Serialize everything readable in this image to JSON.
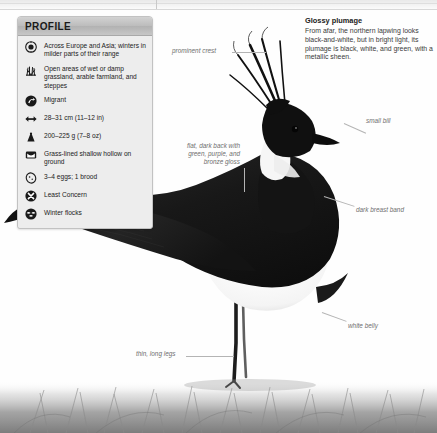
{
  "page": {
    "background_color": "#ffffff",
    "strip_color": "#eeeeee"
  },
  "profile": {
    "title": "PROFILE",
    "rows": [
      {
        "icon": "range-globe-icon",
        "text": "Across Europe and Asia;\nwinters in milder parts\nof their range"
      },
      {
        "icon": "grass-habitat-icon",
        "text": "Open areas of wet or\ndamp grassland, arable\nfarmland, and steppes"
      },
      {
        "icon": "migration-arrow-icon",
        "text": "Migrant"
      },
      {
        "icon": "size-arrows-icon",
        "text": "28–31 cm (11–12 in)"
      },
      {
        "icon": "weight-icon",
        "text": "200–225 g (7–8 oz)"
      },
      {
        "icon": "nest-icon",
        "text": "Grass-lined shallow\nhollow on ground"
      },
      {
        "icon": "egg-icon",
        "text": "3–4 eggs; 1 brood"
      },
      {
        "icon": "conservation-status-icon",
        "text": "Least Concern"
      },
      {
        "icon": "flock-icon",
        "text": "Winter flocks"
      }
    ]
  },
  "info_block": {
    "title": "Glossy plumage",
    "body": "From afar, the northern lapwing looks black-and-white, but in bright light, its plumage is black, white, and green, with a metallic sheen."
  },
  "callouts": [
    {
      "name": "prominent-crest",
      "text": "prominent crest"
    },
    {
      "name": "flat-dark-back",
      "text": "flat, dark back with\ngreen, purple, and\nbronze gloss"
    },
    {
      "name": "small-bill",
      "text": "small bill"
    },
    {
      "name": "dark-breast-band",
      "text": "dark breast band"
    },
    {
      "name": "white-belly",
      "text": "white belly"
    },
    {
      "name": "thin-long-legs",
      "text": "thin, long legs"
    }
  ],
  "subject": {
    "name": "northern-lapwing",
    "body_color": "#1b1b1b",
    "belly_color": "#fbfbfb",
    "ground_color": "#b8b8b8"
  }
}
